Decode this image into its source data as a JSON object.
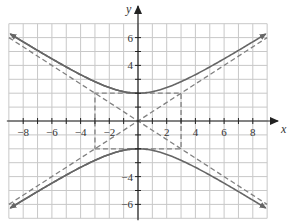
{
  "chart_data": {
    "type": "line",
    "title": "",
    "xlabel": "x",
    "ylabel": "y",
    "xlim": [
      -9,
      9
    ],
    "ylim": [
      -7,
      7
    ],
    "grid": true,
    "legend": null,
    "x_ticks": [
      -8,
      -6,
      -4,
      -2,
      2,
      4,
      6,
      8
    ],
    "x_tick_labels": [
      "−8",
      "−6",
      "−4",
      "−2",
      "2",
      "4",
      "6",
      "8"
    ],
    "y_ticks": [
      6,
      4,
      -4,
      -6
    ],
    "y_tick_labels": [
      "6",
      "4",
      "−4",
      "−6"
    ],
    "series": [
      {
        "name": "hyperbola upper branch",
        "equation": "y^2/4 - x^2/9 = 1, y > 0",
        "style": "solid",
        "arrows": "both ends",
        "points": [
          [
            -9,
            6.32
          ],
          [
            -6,
            4.47
          ],
          [
            -3,
            2.83
          ],
          [
            0,
            2
          ],
          [
            3,
            2.83
          ],
          [
            6,
            4.47
          ],
          [
            9,
            6.32
          ]
        ]
      },
      {
        "name": "hyperbola lower branch",
        "equation": "y^2/4 - x^2/9 = 1, y < 0",
        "style": "solid",
        "arrows": "both ends",
        "points": [
          [
            -9,
            -6.32
          ],
          [
            -6,
            -4.47
          ],
          [
            -3,
            -2.83
          ],
          [
            0,
            -2
          ],
          [
            3,
            -2.83
          ],
          [
            6,
            -4.47
          ],
          [
            9,
            -6.32
          ]
        ]
      },
      {
        "name": "asymptote y = (2/3)x",
        "style": "dashed",
        "points": [
          [
            -9,
            -6
          ],
          [
            9,
            6
          ]
        ]
      },
      {
        "name": "asymptote y = -(2/3)x",
        "style": "dashed",
        "points": [
          [
            -9,
            6
          ],
          [
            9,
            -6
          ]
        ]
      },
      {
        "name": "fundamental rectangle",
        "style": "dashed",
        "points": [
          [
            -3,
            -2
          ],
          [
            3,
            -2
          ],
          [
            3,
            2
          ],
          [
            -3,
            2
          ],
          [
            -3,
            -2
          ]
        ]
      }
    ],
    "vertices": [
      [
        0,
        2
      ],
      [
        0,
        -2
      ]
    ]
  },
  "colors": {
    "curve": "#666666",
    "grid": "#c8c8c8",
    "axis": "#222222",
    "dashed": "#808080",
    "background": "#ffffff"
  }
}
